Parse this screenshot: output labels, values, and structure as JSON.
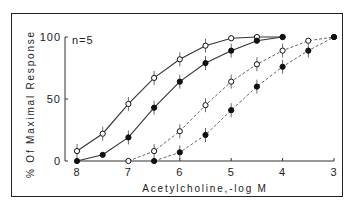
{
  "chart_data": {
    "type": "line",
    "title": "",
    "annotation": "n=5",
    "xlabel": "Acetylcholine,-log M",
    "ylabel": "% Of Maximal Response",
    "x_ticks": [
      "8",
      "7",
      "6",
      "5",
      "4",
      "3"
    ],
    "y_ticks": [
      "0",
      "50",
      "100"
    ],
    "xlim": [
      8,
      3
    ],
    "ylim": [
      0,
      100
    ],
    "grid": false,
    "legend": "none",
    "series": [
      {
        "name": "open circles, solid",
        "marker": "open",
        "line": "solid",
        "x": [
          8,
          7.5,
          7,
          6.5,
          6,
          5.5,
          5,
          4.5,
          4
        ],
        "y": [
          8,
          22,
          46,
          67,
          82,
          93,
          99,
          100,
          100
        ]
      },
      {
        "name": "filled circles, solid",
        "marker": "filled",
        "line": "solid",
        "x": [
          8,
          7.5,
          7,
          6.5,
          6,
          5.5,
          5,
          4.5,
          4
        ],
        "y": [
          0,
          5,
          19,
          43,
          64,
          79,
          89,
          97,
          100
        ]
      },
      {
        "name": "open circles, dashed",
        "marker": "open",
        "line": "dashed",
        "x": [
          7,
          6.5,
          6,
          5.5,
          5,
          4.5,
          4,
          3.5,
          3
        ],
        "y": [
          0,
          8,
          24,
          45,
          64,
          78,
          89,
          97,
          100
        ]
      },
      {
        "name": "filled circles, dashed",
        "marker": "filled",
        "line": "dashed",
        "x": [
          6.5,
          6,
          5.5,
          5,
          4.5,
          4,
          3.5,
          3
        ],
        "y": [
          0,
          7,
          21,
          41,
          60,
          76,
          89,
          100
        ]
      }
    ]
  }
}
